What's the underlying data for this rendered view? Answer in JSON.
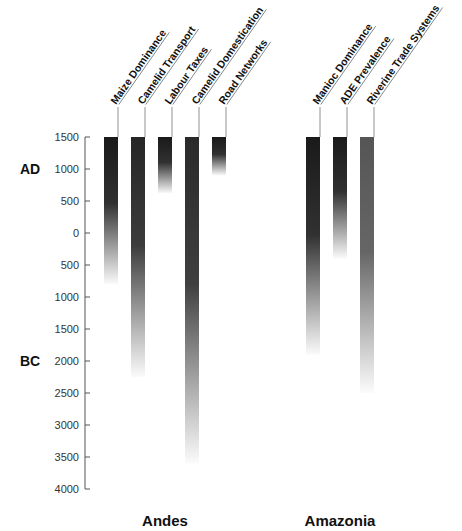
{
  "chart_data": {
    "type": "bar",
    "subtype": "floating-gradient-range",
    "title": "",
    "xlabel": "",
    "ylabel": "",
    "y_axis": {
      "ticks": [
        "1500",
        "1000",
        "500",
        "0",
        "500",
        "1000",
        "1500",
        "2000",
        "2500",
        "3000",
        "3500",
        "4000"
      ],
      "tick_values": [
        1500,
        1000,
        500,
        0,
        -500,
        -1000,
        -1500,
        -2000,
        -2500,
        -3000,
        -3500,
        -4000
      ],
      "era_labels": [
        {
          "label": "AD",
          "at": 1000
        },
        {
          "label": "BC",
          "at": -2000
        }
      ],
      "range": [
        -4000,
        1500
      ]
    },
    "grid": false,
    "groups": [
      {
        "label": "Andes",
        "categories": [
          "Maize Dominance",
          "Camelid Transport",
          "Labour Taxes",
          "Camelid Domestication",
          "Road Networks"
        ],
        "start": [
          1500,
          1500,
          1500,
          1500,
          1500
        ],
        "end": [
          -800,
          -2250,
          620,
          -3600,
          900
        ],
        "peak_shade": [
          "#1a1a1a",
          "#262626",
          "#1a1a1a",
          "#2a2a2a",
          "#1a1a1a"
        ]
      },
      {
        "label": "Amazonia",
        "categories": [
          "Manioc Dominance",
          "ADE Prevalence",
          "Riverine Trade Systems"
        ],
        "start": [
          1500,
          1500,
          1500
        ],
        "end": [
          -1900,
          -400,
          -2500
        ],
        "peak_shade": [
          "#1a1a1a",
          "#1a1a1a",
          "#555555"
        ]
      }
    ]
  }
}
